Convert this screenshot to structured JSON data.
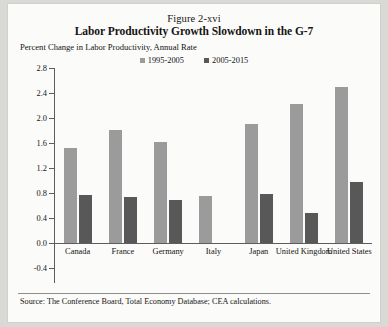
{
  "figure": {
    "number": "Figure 2-xvi",
    "title": "Labor Productivity Growth Slowdown in the G-7",
    "subtitle": "Percent Change in Labor Productivity, Annual Rate",
    "source": "Source: The Conference Board, Total Economy Database; CEA calculations."
  },
  "colors": {
    "series_1995_2005": "#9b9b9b",
    "series_2005_2015": "#585858",
    "axis": "#5d5d5d",
    "page_background": "#fbfbf9",
    "canvas_background": "#d9d9d6"
  },
  "chart_data": {
    "type": "bar",
    "title": "Labor Productivity Growth Slowdown in the G-7",
    "subtitle": "Percent Change in Labor Productivity, Annual Rate",
    "xlabel": "",
    "ylabel": "Percent Change in Labor Productivity, Annual Rate",
    "ylim": [
      -0.4,
      2.8
    ],
    "yticks": [
      "2.8",
      "2.4",
      "2.0",
      "1.6",
      "1.2",
      "0.8",
      "0.4",
      "0.0",
      "-0.4"
    ],
    "ytick_values": [
      2.8,
      2.4,
      2.0,
      1.6,
      1.2,
      0.8,
      0.4,
      0.0,
      -0.4
    ],
    "grid": false,
    "legend_position": "top-center",
    "categories": [
      "Canada",
      "France",
      "Germany",
      "Italy",
      "Japan",
      "United Kingdom",
      "United States"
    ],
    "series": [
      {
        "name": "1995-2005",
        "color": "#9b9b9b",
        "values": [
          1.52,
          1.81,
          1.62,
          0.75,
          1.9,
          2.22,
          2.5
        ]
      },
      {
        "name": "2005-2015",
        "color": "#585858",
        "values": [
          0.77,
          0.73,
          0.69,
          0.0,
          0.78,
          0.48,
          0.97
        ]
      }
    ]
  }
}
